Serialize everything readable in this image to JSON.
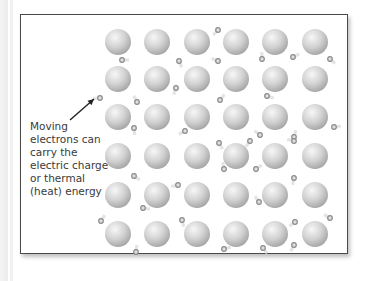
{
  "diagram": {
    "caption_lines": [
      "Moving",
      "electrons can",
      "carry the",
      "electric charge",
      "or thermal",
      "(heat) energy"
    ],
    "colors": {
      "frame_border": "#4a4a4a",
      "atom_light": "#f4f4f4",
      "atom_dark": "#a8a8a8",
      "electron": "#8a8a8a",
      "text": "#3a3a3a",
      "arrow": "#222222"
    },
    "atoms": {
      "columns_x": [
        118,
        157,
        197,
        236,
        275,
        315
      ],
      "rows_y": [
        42,
        79,
        117,
        156,
        195,
        234
      ],
      "radius": 13
    },
    "electrons": [
      [
        122,
        60
      ],
      [
        179,
        61
      ],
      [
        218,
        30
      ],
      [
        218,
        61
      ],
      [
        262,
        59
      ],
      [
        293,
        57
      ],
      [
        330,
        59
      ],
      [
        176,
        88
      ],
      [
        100,
        98
      ],
      [
        137,
        102
      ],
      [
        220,
        100
      ],
      [
        267,
        96
      ],
      [
        134,
        128
      ],
      [
        185,
        131
      ],
      [
        260,
        135
      ],
      [
        294,
        137
      ],
      [
        334,
        127
      ],
      [
        219,
        143
      ],
      [
        250,
        141
      ],
      [
        294,
        141
      ],
      [
        224,
        169
      ],
      [
        256,
        169
      ],
      [
        134,
        176
      ],
      [
        294,
        178
      ],
      [
        178,
        185
      ],
      [
        259,
        202
      ],
      [
        101,
        221
      ],
      [
        143,
        208
      ],
      [
        182,
        220
      ],
      [
        295,
        222
      ],
      [
        330,
        218
      ],
      [
        136,
        252
      ],
      [
        224,
        249
      ],
      [
        263,
        248
      ],
      [
        294,
        245
      ]
    ],
    "arrow": {
      "from": [
        70,
        120
      ],
      "to": [
        94,
        99
      ]
    }
  }
}
